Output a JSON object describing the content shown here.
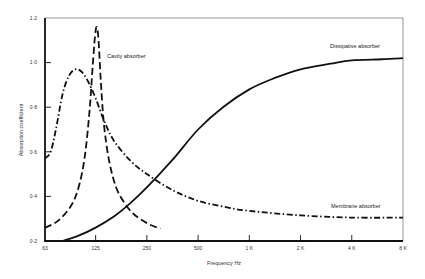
{
  "chart_data": {
    "type": "line",
    "title": "",
    "xlabel": "Frequency Hz",
    "ylabel": "Absorption coefficient",
    "xscale": "log2",
    "x_ticks": [
      63,
      125,
      250,
      500,
      1000,
      2000,
      4000,
      8000
    ],
    "x_tick_labels": [
      "63",
      "125",
      "250",
      "500",
      "1 K",
      "2 K",
      "4 K",
      "8 K"
    ],
    "y_ticks": [
      0.2,
      0.4,
      0.6,
      0.8,
      1.0,
      1.2
    ],
    "y_tick_labels": [
      "0·2",
      "0·4",
      "0·6",
      "0·8",
      "1·0",
      "1·2"
    ],
    "xlim": [
      63,
      8000
    ],
    "ylim": [
      0.2,
      1.2
    ],
    "grid": false,
    "legend": "none (inline annotations)",
    "series": [
      {
        "name": "Cavity absorber",
        "style": "dashed",
        "points": [
          [
            63,
            0.26
          ],
          [
            75,
            0.29
          ],
          [
            90,
            0.36
          ],
          [
            100,
            0.45
          ],
          [
            108,
            0.58
          ],
          [
            115,
            0.78
          ],
          [
            120,
            0.98
          ],
          [
            124,
            1.12
          ],
          [
            127,
            1.16
          ],
          [
            130,
            1.1
          ],
          [
            134,
            0.92
          ],
          [
            140,
            0.72
          ],
          [
            150,
            0.56
          ],
          [
            165,
            0.44
          ],
          [
            185,
            0.37
          ],
          [
            210,
            0.32
          ],
          [
            250,
            0.28
          ],
          [
            300,
            0.255
          ]
        ]
      },
      {
        "name": "Membrane absorber",
        "style": "dash-dot",
        "points": [
          [
            63,
            0.57
          ],
          [
            68,
            0.6
          ],
          [
            73,
            0.7
          ],
          [
            80,
            0.86
          ],
          [
            87,
            0.94
          ],
          [
            95,
            0.97
          ],
          [
            103,
            0.96
          ],
          [
            112,
            0.92
          ],
          [
            125,
            0.84
          ],
          [
            140,
            0.74
          ],
          [
            160,
            0.65
          ],
          [
            200,
            0.56
          ],
          [
            250,
            0.5
          ],
          [
            350,
            0.43
          ],
          [
            500,
            0.38
          ],
          [
            750,
            0.35
          ],
          [
            1000,
            0.335
          ],
          [
            2000,
            0.315
          ],
          [
            4000,
            0.305
          ],
          [
            8000,
            0.305
          ]
        ]
      },
      {
        "name": "Dissipative absorber",
        "style": "solid",
        "points": [
          [
            80,
            0.2
          ],
          [
            100,
            0.225
          ],
          [
            125,
            0.26
          ],
          [
            160,
            0.31
          ],
          [
            200,
            0.37
          ],
          [
            250,
            0.44
          ],
          [
            350,
            0.56
          ],
          [
            500,
            0.7
          ],
          [
            700,
            0.8
          ],
          [
            1000,
            0.88
          ],
          [
            1400,
            0.93
          ],
          [
            2000,
            0.97
          ],
          [
            3000,
            0.995
          ],
          [
            4000,
            1.01
          ],
          [
            6000,
            1.015
          ],
          [
            8000,
            1.02
          ]
        ]
      }
    ],
    "annotations": [
      {
        "text": "Cavity absorber",
        "x_px": 107,
        "y_px": 58
      },
      {
        "text": "Dissipative absorber",
        "x_px": 330,
        "y_px": 48
      },
      {
        "text": "Membrane absorber",
        "x_px": 331,
        "y_px": 208
      }
    ]
  }
}
